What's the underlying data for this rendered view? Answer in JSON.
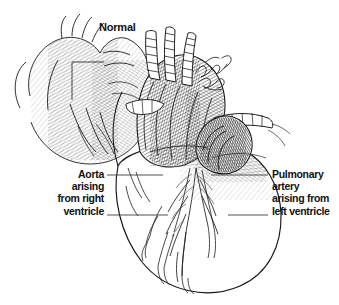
{
  "figure": {
    "title": "Normal",
    "background_color": "#ffffff",
    "ink_color": "#111111",
    "artist_signature": "cursive-signature"
  },
  "callouts": [
    {
      "id": "aorta-right-ventricle",
      "side": "left",
      "align": "right",
      "lines": [
        "Aorta",
        "arising",
        "from right",
        "ventricle"
      ]
    },
    {
      "id": "pulmonary-artery-left-ventricle",
      "side": "right",
      "align": "left",
      "lines": [
        "Pulmonary",
        "artery",
        "arising from",
        "left ventricle"
      ]
    }
  ],
  "leader_lines": [
    {
      "id": "leader-left-upper",
      "x1": 107,
      "y1": 175,
      "x2": 163,
      "y2": 175
    },
    {
      "id": "leader-left-lower",
      "x1": 107,
      "y1": 215,
      "x2": 168,
      "y2": 215
    },
    {
      "id": "leader-right-upper",
      "x1": 211,
      "y1": 175,
      "x2": 268,
      "y2": 175
    },
    {
      "id": "leader-right-lower",
      "x1": 228,
      "y1": 215,
      "x2": 268,
      "y2": 215
    }
  ]
}
